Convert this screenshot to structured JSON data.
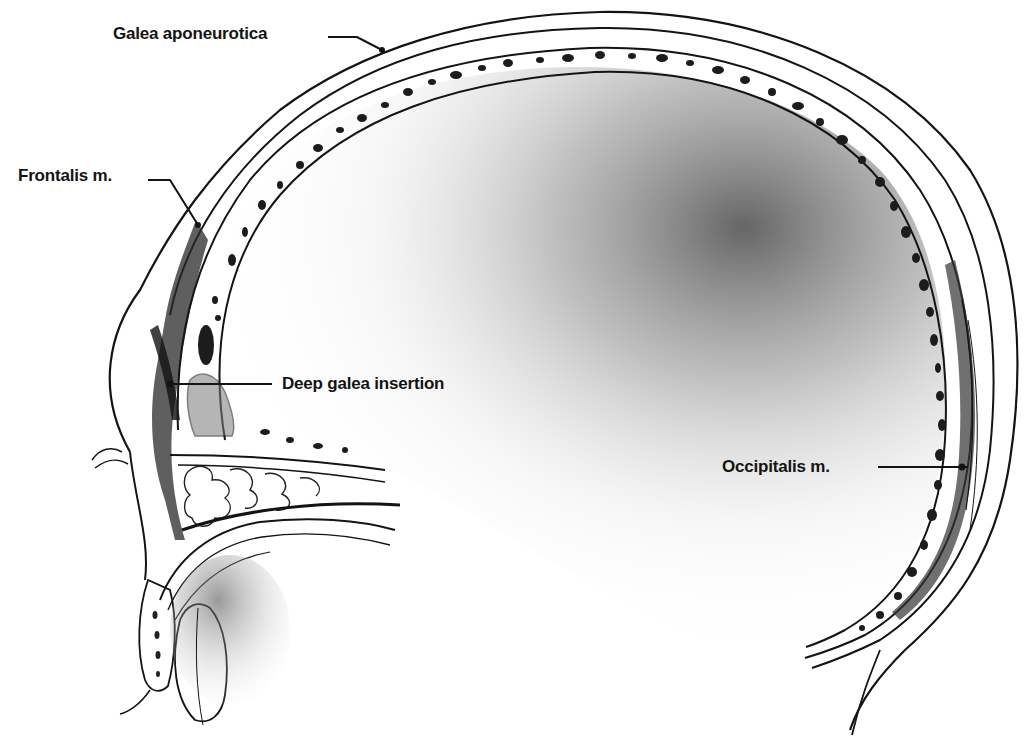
{
  "figure": {
    "type": "anatomical-illustration",
    "labels": [
      {
        "id": "galea",
        "text": "Galea aponeurotica",
        "x": 113,
        "y": 22
      },
      {
        "id": "frontalis",
        "text": "Frontalis m.",
        "x": 18,
        "y": 164
      },
      {
        "id": "deep-galea",
        "text": "Deep galea insertion",
        "x": 282,
        "y": 374
      },
      {
        "id": "occipitalis",
        "text": "Occipitalis m.",
        "x": 722,
        "y": 457
      }
    ],
    "colors": {
      "ink": "#141414",
      "paper": "#ffffff",
      "shade": "#6e6e6e"
    }
  }
}
